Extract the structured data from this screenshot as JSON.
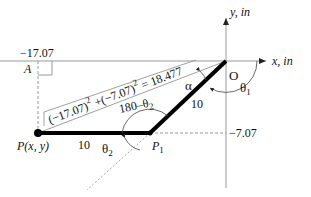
{
  "axes": {
    "x_label": "x, in",
    "y_label": "y, in",
    "origin_label": "O"
  },
  "points": {
    "P": "P(x, y)",
    "P1": "P",
    "P1_sub": "1",
    "A": "A"
  },
  "values": {
    "x_coord": "−17.07",
    "y_coord": "−7.07"
  },
  "links": {
    "link1_length": "10",
    "link2_length": "10"
  },
  "angles": {
    "theta1": "θ",
    "theta1_sub": "1",
    "theta2": "θ",
    "theta2_sub": "2",
    "supplement": "180–θ",
    "supplement_sub": "2",
    "alpha": "α"
  },
  "formula": {
    "part1": "(−17.07)",
    "exp1": "2",
    "plus": " +(−7.07)",
    "exp2": "2",
    "result": " = 18.477"
  },
  "colors": {
    "link": "#000000",
    "axis": "#888888",
    "dashed": "#999999"
  }
}
